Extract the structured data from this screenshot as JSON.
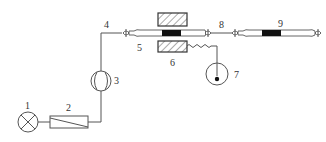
{
  "diagram": {
    "type": "schematic",
    "stroke_color": "#555555",
    "fill_dark": "#111111",
    "components": [
      {
        "id": "1",
        "label": "1",
        "shape": "circle-with-cross",
        "icon": "lamp-icon"
      },
      {
        "id": "2",
        "label": "2",
        "shape": "rectangle-with-diagonal",
        "icon": "filter-icon"
      },
      {
        "id": "3",
        "label": "3",
        "shape": "circle-with-arcs",
        "icon": "flowmeter-icon"
      },
      {
        "id": "4",
        "label": "4",
        "shape": "line",
        "icon": "pipe-icon"
      },
      {
        "id": "5",
        "label": "5",
        "shape": "tube",
        "icon": "tube-icon"
      },
      {
        "id": "6",
        "label": "6",
        "shape": "hatched-blocks",
        "icon": "heater-icon"
      },
      {
        "id": "7",
        "label": "7",
        "shape": "circle-with-dot",
        "icon": "gauge-icon"
      },
      {
        "id": "8",
        "label": "8",
        "shape": "line",
        "icon": "pipe-icon"
      },
      {
        "id": "9",
        "label": "9",
        "shape": "tube-with-block",
        "icon": "tube-icon"
      }
    ],
    "labels": {
      "l1": "1",
      "l2": "2",
      "l3": "3",
      "l4": "4",
      "l5": "5",
      "l6": "6",
      "l7": "7",
      "l8": "8",
      "l9": "9"
    }
  }
}
